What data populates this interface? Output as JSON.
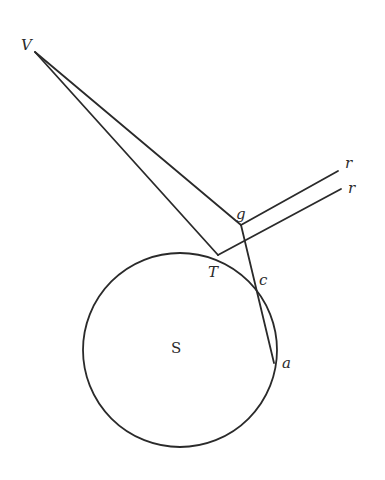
{
  "diagram": {
    "labels": {
      "V": "V",
      "g": "g",
      "r1": "r",
      "r2": "r",
      "T": "T",
      "c": "c",
      "a": "a",
      "S": "S"
    },
    "colors": {
      "ink": "#2a2a2a",
      "background": "#ffffff"
    }
  }
}
